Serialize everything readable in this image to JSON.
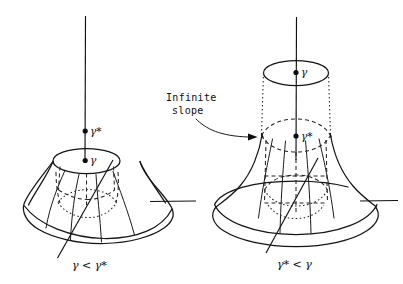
{
  "figure": {
    "kind": "hand-drawn-math-diagram",
    "background_color": "#ffffff",
    "ink_color": "#0d0d0d",
    "width": 403,
    "height": 284
  },
  "left_figure": {
    "name": "truncated-cone-surface",
    "caption": "γ < γ*",
    "caption_gamma": "γ",
    "caption_relation": "<",
    "caption_gamma_star": "γ*",
    "axis_label_upper": "γ*",
    "axis_label_lower": "γ",
    "upper_point_symbol": "γ*",
    "lower_point_symbol": "γ",
    "shape_note": "flat-topped truncated cone, finite slope at rim"
  },
  "right_figure": {
    "name": "bell-trumpet-surface",
    "caption": "γ* < γ",
    "caption_gamma_star": "γ*",
    "caption_relation": "<",
    "caption_gamma": "γ",
    "axis_label_upper": "γ",
    "axis_label_lower": "γ*",
    "upper_point_symbol": "γ",
    "lower_point_symbol": "γ*",
    "shape_note": "cylinder above, flaring bell below, vertical tangent at rim"
  },
  "annotation": {
    "name": "infinite-slope-callout",
    "line1": "Infinite",
    "line2": "slope",
    "full_text": "Infinite slope",
    "arrow": "curved-arrow-pointing-right-down"
  },
  "symbols": {
    "gamma": "γ",
    "gamma_star": "γ*",
    "less_than": "<",
    "star": "*"
  }
}
